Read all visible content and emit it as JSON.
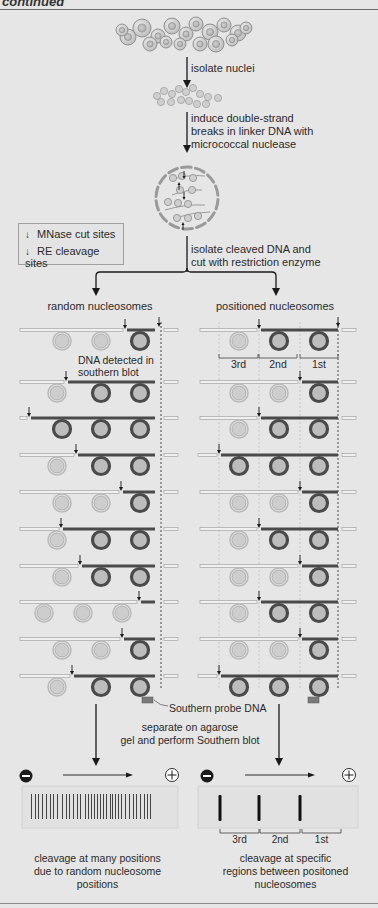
{
  "header": {
    "title": "continued"
  },
  "steps": {
    "isolate_nuclei": "isolate nuclei",
    "induce_breaks": [
      "induce double-strand",
      "breaks in linker DNA with",
      "micrococcal nuclease"
    ],
    "isolate_cleaved": [
      "isolate cleaved DNA and",
      "cut with restriction enzyme"
    ],
    "separate": [
      "separate on agarose",
      "gel and perform Southern blot"
    ]
  },
  "legend": {
    "items": [
      {
        "icon": "down-arrow",
        "label": "MNase cut sites"
      },
      {
        "icon": "down-arrow",
        "label": "RE cleavage sites"
      }
    ]
  },
  "left_panel": {
    "title": "random nucleosomes",
    "annotation": [
      "DNA detected in",
      "southern blot"
    ],
    "rows": [
      {
        "cut_x": 125,
        "dark": 1,
        "light": 2
      },
      {
        "cut_x": 66,
        "dark": 2,
        "light": 1
      },
      {
        "cut_x": 29,
        "dark": 3,
        "light": 0
      },
      {
        "cut_x": 76,
        "dark": 2,
        "light": 1
      },
      {
        "cut_x": 121,
        "dark": 1,
        "light": 2
      },
      {
        "cut_x": 61,
        "dark": 2,
        "light": 1
      },
      {
        "cut_x": 80,
        "dark": 2,
        "light": 1
      },
      {
        "cut_x": 139,
        "dark": 0,
        "light": 3
      },
      {
        "cut_x": 122,
        "dark": 1,
        "light": 2
      },
      {
        "cut_x": 72,
        "dark": 2,
        "light": 1
      }
    ],
    "probe_label": "Southern probe DNA",
    "gel_caption": [
      "cleavage at many positions",
      "due to random nucleosome",
      "positions"
    ]
  },
  "right_panel": {
    "title": "positioned nucleosomes",
    "segment_labels": [
      "3rd",
      "2nd",
      "1st"
    ],
    "rows": [
      {
        "dark": 2
      },
      {
        "dark": 1
      },
      {
        "dark": 2
      },
      {
        "dark": 3
      },
      {
        "dark": 1
      },
      {
        "dark": 2
      },
      {
        "dark": 1
      },
      {
        "dark": 2
      },
      {
        "dark": 1
      },
      {
        "dark": 3
      }
    ],
    "gel_labels": [
      "3rd",
      "2nd",
      "1st"
    ],
    "gel_caption": [
      "cleavage at specific",
      "regions between positoned",
      "nucleosomes"
    ]
  },
  "gel": {
    "negative_symbol": "−",
    "positive_symbol": "+"
  },
  "colors": {
    "background": "#e6e6e6",
    "dark_nucleosome": "#4a4a4a",
    "light_nucleosome": "#c4c4c4",
    "probe": "#7a7a7a",
    "arrow": "#1a1a1a"
  }
}
